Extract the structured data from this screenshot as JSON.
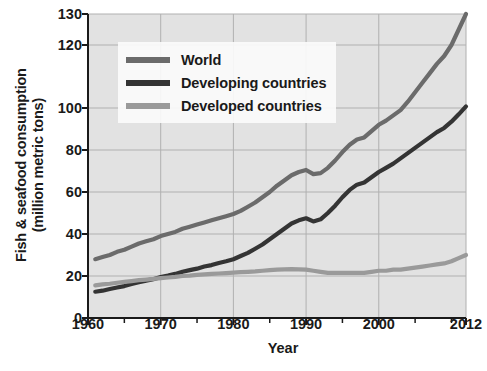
{
  "chart_data": {
    "type": "line",
    "title": "",
    "xlabel": "Year",
    "ylabel": "Fish & seafood consumption (million metric tons)",
    "ylabel_line1": "Fish & seafood consumption",
    "ylabel_line2": "(million metric tons)",
    "xlim": [
      1960,
      2012
    ],
    "ylim": [
      0,
      130
    ],
    "grid": true,
    "legend_position": "upper-left",
    "y_ticks": [
      0,
      20,
      40,
      60,
      80,
      100,
      120,
      130
    ],
    "y_tick_labels": [
      "0",
      "20",
      "40",
      "60",
      "80",
      "100",
      "120",
      "130"
    ],
    "x_ticks": [
      1960,
      1970,
      1980,
      1990,
      2000,
      2012
    ],
    "x_tick_labels": [
      "1960",
      "1970",
      "1980",
      "1990",
      "2000",
      "2012"
    ],
    "x_minor_ticks": [
      1965,
      1975,
      1985,
      1995,
      2005,
      2010
    ],
    "colors": {
      "world": "#6b6b6b",
      "developing": "#343434",
      "developed": "#9a9a9a",
      "plot_background": "#e2e2e2",
      "gridline": "#b0b0b0",
      "axis": "#1a1a1a",
      "text": "#1a1a1a"
    },
    "x": [
      1961,
      1962,
      1963,
      1964,
      1965,
      1966,
      1967,
      1968,
      1969,
      1970,
      1971,
      1972,
      1973,
      1974,
      1975,
      1976,
      1977,
      1978,
      1979,
      1980,
      1981,
      1982,
      1983,
      1984,
      1985,
      1986,
      1987,
      1988,
      1989,
      1990,
      1991,
      1992,
      1993,
      1994,
      1995,
      1996,
      1997,
      1998,
      1999,
      2000,
      2001,
      2002,
      2003,
      2004,
      2005,
      2006,
      2007,
      2008,
      2009,
      2010,
      2011,
      2012
    ],
    "series": [
      {
        "name": "World",
        "color": "#6b6b6b",
        "values": [
          28.0,
          29.0,
          30.0,
          31.5,
          32.5,
          34.0,
          35.5,
          36.5,
          37.5,
          39.0,
          40.0,
          41.0,
          42.5,
          43.5,
          44.5,
          45.5,
          46.5,
          47.5,
          48.5,
          49.5,
          51.0,
          53.0,
          55.0,
          57.5,
          60.0,
          63.0,
          65.5,
          68.0,
          69.5,
          70.5,
          68.5,
          69.0,
          71.5,
          75.0,
          79.0,
          82.5,
          85.0,
          86.0,
          89.0,
          92.0,
          94.0,
          96.5,
          99.0,
          102.0,
          105.0,
          108.0,
          111.0,
          114.0,
          116.5,
          120.0,
          125.0,
          130.0
        ]
      },
      {
        "name": "Developing countries",
        "color": "#343434",
        "values": [
          12.5,
          13.0,
          13.8,
          14.5,
          15.2,
          16.2,
          17.0,
          17.8,
          18.5,
          19.5,
          20.2,
          21.0,
          22.0,
          22.8,
          23.5,
          24.5,
          25.2,
          26.2,
          27.0,
          28.0,
          29.5,
          31.0,
          33.0,
          35.0,
          37.5,
          40.0,
          42.5,
          45.0,
          46.5,
          47.5,
          46.0,
          47.0,
          50.0,
          53.5,
          57.5,
          61.0,
          63.5,
          64.5,
          67.0,
          69.5,
          71.5,
          73.5,
          76.0,
          78.5,
          81.0,
          83.5,
          86.0,
          88.5,
          90.5,
          93.5,
          97.0,
          100.5
        ]
      },
      {
        "name": "Developed countries",
        "color": "#9a9a9a",
        "values": [
          15.5,
          16.0,
          16.3,
          16.8,
          17.2,
          17.6,
          18.0,
          18.3,
          18.6,
          19.0,
          19.3,
          19.6,
          20.0,
          20.2,
          20.5,
          20.8,
          21.0,
          21.2,
          21.4,
          21.6,
          21.8,
          22.0,
          22.2,
          22.5,
          22.8,
          23.0,
          23.2,
          23.3,
          23.2,
          23.0,
          22.5,
          22.0,
          21.5,
          21.5,
          21.5,
          21.5,
          21.5,
          21.5,
          22.0,
          22.5,
          22.5,
          23.0,
          23.0,
          23.5,
          24.0,
          24.5,
          25.0,
          25.5,
          26.0,
          27.0,
          28.5,
          30.0
        ]
      }
    ],
    "legend": [
      {
        "label": "World",
        "color": "#6b6b6b"
      },
      {
        "label": "Developing countries",
        "color": "#343434"
      },
      {
        "label": "Developed countries",
        "color": "#9a9a9a"
      }
    ]
  }
}
